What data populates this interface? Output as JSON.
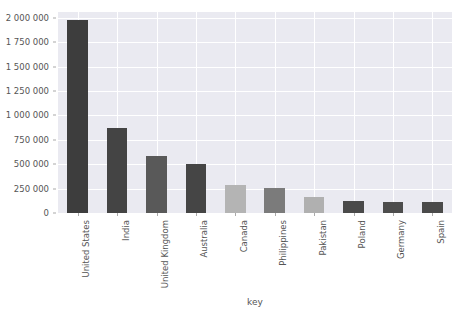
{
  "chart_data": {
    "type": "bar",
    "title": "",
    "xlabel": "key",
    "ylabel": "",
    "categories": [
      "United States",
      "India",
      "United Kingdom",
      "Australia",
      "Canada",
      "Philippines",
      "Pakistan",
      "Poland",
      "Germany",
      "Spain"
    ],
    "values": [
      1975000,
      876000,
      588000,
      505000,
      290000,
      258000,
      160000,
      123000,
      118000,
      115000
    ],
    "ylim": [
      0,
      2060000
    ],
    "ytick_values": [
      0,
      250000,
      500000,
      750000,
      1000000,
      1250000,
      1500000,
      1750000,
      2000000
    ],
    "ytick_labels": [
      "0",
      "250 000",
      "500 000",
      "750 000",
      "1 000 000",
      "1 250 000",
      "1 500 000",
      "1 750 000",
      "2 000 000"
    ],
    "bar_colors": [
      "#3d3d3d",
      "#444444",
      "#595959",
      "#454545",
      "#b4b4b4",
      "#7b7b7b",
      "#b0b0b0",
      "#4a4a4a",
      "#4d4d4d",
      "#4a4a4a"
    ],
    "grid": true,
    "legend": "none",
    "plot_background": "#eaeaf1",
    "gridline_color": "#ffffff",
    "bar_width_ratio": 0.52
  },
  "axes": {
    "x_title": "key"
  }
}
